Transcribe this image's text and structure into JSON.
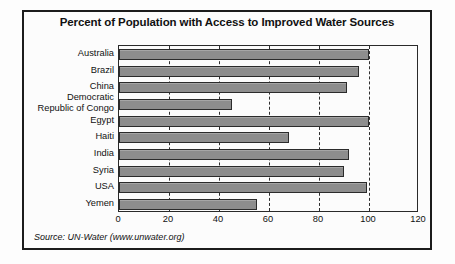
{
  "chart_data": {
    "type": "bar",
    "orientation": "horizontal",
    "title": "Percent of Population with Access to Improved Water Sources",
    "xlabel": "",
    "ylabel": "",
    "xlim": [
      0,
      120
    ],
    "xticks": [
      0,
      20,
      40,
      60,
      80,
      100,
      120
    ],
    "grid": "vertical-dashed",
    "legend": "none",
    "source_note": "Source: UN-Water (www.unwater.org)",
    "bar_color": "#8d8d8d",
    "bar_edge_color": "#2b2b2b",
    "categories": [
      "Australia",
      "Brazil",
      "China",
      "Democratic\nRepublic of Congo",
      "Egypt",
      "Haiti",
      "India",
      "Syria",
      "USA",
      "Yemen"
    ],
    "values": [
      100,
      96,
      91,
      45,
      100,
      68,
      92,
      90,
      99,
      55
    ]
  }
}
